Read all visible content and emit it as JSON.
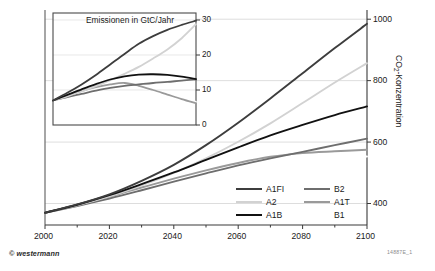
{
  "figure": {
    "credit": "© westermann",
    "code": "14887E_1"
  },
  "main_axis": {
    "y_title_main": "CO",
    "y_title_sub": "2",
    "y_title_rest": "-Konzentration",
    "y_ticks": [
      "400",
      "600",
      "800",
      "1000"
    ],
    "x_ticks": [
      "2000",
      "2020",
      "2040",
      "2060",
      "2080",
      "2100"
    ]
  },
  "inset_axis": {
    "title": "Emissionen in GtC/Jahr",
    "y_ticks": [
      "0",
      "10",
      "20",
      "30"
    ]
  },
  "legend": {
    "items": [
      {
        "label": "A1FI",
        "color": "#3d3d3d",
        "has_swatch": true
      },
      {
        "label": "A2",
        "color": "#d2d2d2",
        "has_swatch": true
      },
      {
        "label": "A1B",
        "color": "#111111",
        "has_swatch": true
      },
      {
        "label": "B2",
        "color": "#6e6e6e",
        "has_swatch": true
      },
      {
        "label": "A1T",
        "color": "#9a9a9a",
        "has_swatch": true
      },
      {
        "label": "B1",
        "color": "#ffffff",
        "has_swatch": false
      }
    ]
  },
  "chart_data": {
    "type": "line",
    "xlabel": "",
    "ylabel": "CO2-Konzentration",
    "xlim": [
      2000,
      2100
    ],
    "ylim": [
      330,
      1030
    ],
    "grid": true,
    "legend_position": "inside-bottom-right",
    "x": [
      2000,
      2010,
      2020,
      2030,
      2040,
      2050,
      2060,
      2070,
      2080,
      2090,
      2100
    ],
    "series": [
      {
        "name": "A1FI",
        "color": "#3d3d3d",
        "values": [
          370,
          397,
          430,
          474,
          526,
          590,
          663,
          742,
          824,
          906,
          985
        ]
      },
      {
        "name": "A2",
        "color": "#d2d2d2",
        "values": [
          370,
          394,
          423,
          459,
          500,
          547,
          601,
          661,
          727,
          794,
          857
        ]
      },
      {
        "name": "A1B",
        "color": "#111111",
        "values": [
          370,
          396,
          427,
          463,
          501,
          542,
          583,
          622,
          656,
          688,
          716
        ]
      },
      {
        "name": "B2",
        "color": "#6e6e6e",
        "values": [
          370,
          392,
          416,
          443,
          471,
          498,
          524,
          547,
          568,
          590,
          611
        ]
      },
      {
        "name": "A1T",
        "color": "#9a9a9a",
        "values": [
          370,
          394,
          422,
          452,
          481,
          508,
          532,
          552,
          564,
          570,
          575
        ]
      },
      {
        "name": "B1",
        "color": "#ffffff",
        "values": [
          370,
          392,
          416,
          442,
          468,
          492,
          513,
          530,
          543,
          550,
          553
        ]
      }
    ],
    "inset": {
      "type": "line",
      "title": "Emissionen in GtC/Jahr",
      "ylabel": "GtC/Jahr",
      "xlim": [
        2000,
        2050
      ],
      "ylim": [
        0,
        32
      ],
      "grid": true,
      "x": [
        2000,
        2005,
        2010,
        2015,
        2020,
        2025,
        2030,
        2035,
        2040,
        2045,
        2050
      ],
      "series": [
        {
          "name": "A1FI",
          "color": "#3d3d3d",
          "values": [
            7.0,
            9.2,
            11.6,
            14.3,
            17.3,
            20.3,
            23.2,
            25.4,
            27.2,
            28.6,
            29.8
          ]
        },
        {
          "name": "A2",
          "color": "#d2d2d2",
          "values": [
            7.0,
            8.2,
            9.6,
            11.1,
            12.8,
            14.6,
            16.6,
            19.0,
            21.6,
            24.8,
            28.8
          ]
        },
        {
          "name": "A1B",
          "color": "#111111",
          "values": [
            7.0,
            8.6,
            10.2,
            11.7,
            13.0,
            13.9,
            14.4,
            14.5,
            14.3,
            13.8,
            13.1
          ]
        },
        {
          "name": "B2",
          "color": "#6e6e6e",
          "values": [
            7.0,
            8.0,
            8.9,
            9.8,
            10.6,
            11.2,
            11.6,
            12.0,
            12.3,
            12.7,
            13.0
          ]
        },
        {
          "name": "A1T",
          "color": "#9a9a9a",
          "values": [
            7.0,
            8.4,
            9.7,
            10.8,
            11.6,
            12.0,
            11.2,
            10.0,
            8.7,
            7.4,
            6.2
          ]
        },
        {
          "name": "B1",
          "color": "#ffffff",
          "values": [
            7.0,
            8.1,
            9.1,
            10.0,
            10.7,
            11.0,
            10.7,
            9.9,
            8.9,
            7.8,
            6.6
          ]
        }
      ]
    }
  }
}
